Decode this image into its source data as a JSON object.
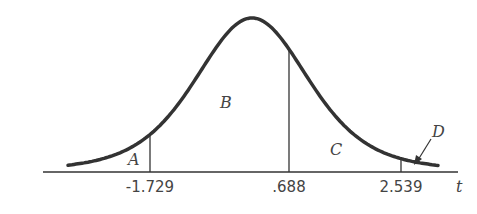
{
  "figure": {
    "axis_label": "t",
    "ticks": [
      "-1.729",
      ".688",
      "2.539"
    ],
    "regions": [
      "A",
      "B",
      "C",
      "D"
    ]
  },
  "chart_data": {
    "type": "area",
    "title": "",
    "xlabel": "t",
    "ylabel": "",
    "x_markers": [
      -1.729,
      0.688,
      2.539
    ],
    "regions": [
      {
        "name": "A",
        "from": null,
        "to": -1.729
      },
      {
        "name": "B",
        "from": -1.729,
        "to": 0.688
      },
      {
        "name": "C",
        "from": 0.688,
        "to": 2.539
      },
      {
        "name": "D",
        "from": 2.539,
        "to": null
      }
    ],
    "grid": false,
    "legend": "none"
  }
}
